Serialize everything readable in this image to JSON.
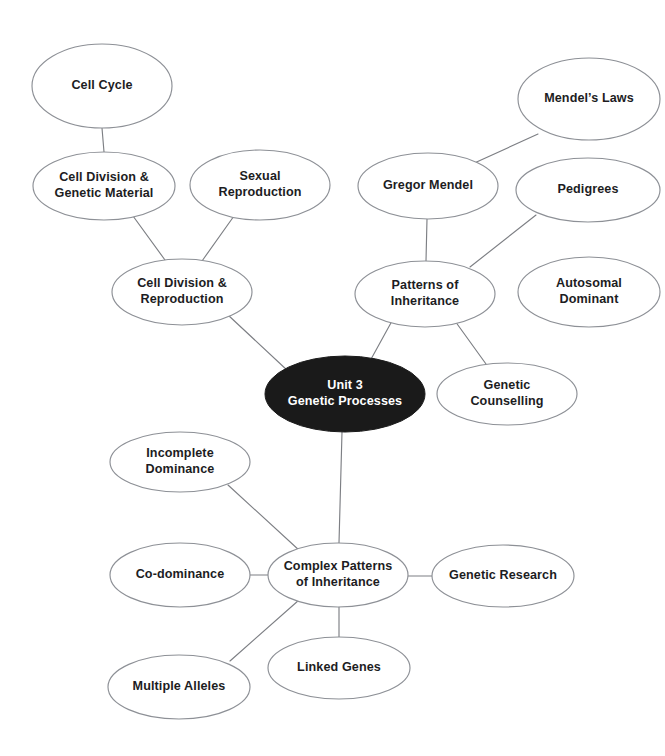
{
  "diagram": {
    "type": "mind-map",
    "background_color": "#ffffff",
    "node_fill_color": "#ffffff",
    "node_stroke_color": "#8d9096",
    "root_fill_color": "#1a1a1a",
    "root_text_color": "#ffffff",
    "edge_color": "#7d7f84",
    "text_color": "#1d1d1f"
  },
  "nodes": [
    {
      "id": "cell-cycle",
      "lines": [
        "Cell Cycle"
      ],
      "cx": 102,
      "cy": 86,
      "rx": 70,
      "ry": 42,
      "root": false
    },
    {
      "id": "cell-division-genetic-material",
      "lines": [
        "Cell Division &",
        "Genetic Material"
      ],
      "cx": 104,
      "cy": 186,
      "rx": 71,
      "ry": 34,
      "root": false
    },
    {
      "id": "sexual-reproduction",
      "lines": [
        "Sexual",
        "Reproduction"
      ],
      "cx": 260,
      "cy": 185,
      "rx": 70,
      "ry": 35,
      "root": false
    },
    {
      "id": "cell-division-reproduction",
      "lines": [
        "Cell Division &",
        "Reproduction"
      ],
      "cx": 182,
      "cy": 292,
      "rx": 70,
      "ry": 33,
      "root": false
    },
    {
      "id": "mendels-laws",
      "lines": [
        "Mendel’s Laws"
      ],
      "cx": 589,
      "cy": 99,
      "rx": 71,
      "ry": 41,
      "root": false
    },
    {
      "id": "gregor-mendel",
      "lines": [
        "Gregor Mendel"
      ],
      "cx": 428,
      "cy": 186,
      "rx": 70,
      "ry": 33,
      "root": false
    },
    {
      "id": "pedigrees",
      "lines": [
        "Pedigrees"
      ],
      "cx": 588,
      "cy": 190,
      "rx": 72,
      "ry": 32,
      "root": false
    },
    {
      "id": "patterns-of-inheritance",
      "lines": [
        "Patterns of",
        "Inheritance"
      ],
      "cx": 425,
      "cy": 294,
      "rx": 70,
      "ry": 33,
      "root": false
    },
    {
      "id": "autosomal-dominant",
      "lines": [
        "Autosomal",
        "Dominant"
      ],
      "cx": 589,
      "cy": 292,
      "rx": 71,
      "ry": 35,
      "root": false
    },
    {
      "id": "genetic-counselling",
      "lines": [
        "Genetic",
        "Counselling"
      ],
      "cx": 507,
      "cy": 394,
      "rx": 70,
      "ry": 31,
      "root": false
    },
    {
      "id": "unit-3-genetic-processes",
      "lines": [
        "Unit 3",
        "Genetic Processes"
      ],
      "cx": 345,
      "cy": 394,
      "rx": 80,
      "ry": 38,
      "root": true
    },
    {
      "id": "incomplete-dominance",
      "lines": [
        "Incomplete",
        "Dominance"
      ],
      "cx": 180,
      "cy": 462,
      "rx": 70,
      "ry": 30,
      "root": false
    },
    {
      "id": "co-dominance",
      "lines": [
        "Co-dominance"
      ],
      "cx": 180,
      "cy": 575,
      "rx": 70,
      "ry": 32,
      "root": false
    },
    {
      "id": "complex-patterns-of-inheritance",
      "lines": [
        "Complex Patterns",
        "of Inheritance"
      ],
      "cx": 338,
      "cy": 575,
      "rx": 70,
      "ry": 32,
      "root": false
    },
    {
      "id": "genetic-research",
      "lines": [
        "Genetic Research"
      ],
      "cx": 503,
      "cy": 576,
      "rx": 71,
      "ry": 31,
      "root": false
    },
    {
      "id": "linked-genes",
      "lines": [
        "Linked Genes"
      ],
      "cx": 339,
      "cy": 668,
      "rx": 71,
      "ry": 31,
      "root": false
    },
    {
      "id": "multiple-alleles",
      "lines": [
        "Multiple Alleles"
      ],
      "cx": 179,
      "cy": 687,
      "rx": 71,
      "ry": 32,
      "root": false
    }
  ],
  "edges": [
    {
      "id": "edge-cell-cycle-to-cdgm",
      "from": "cell-cycle",
      "to": "cell-division-genetic-material",
      "x1": 102,
      "y1": 128,
      "x2": 104,
      "y2": 152
    },
    {
      "id": "edge-cdgm-to-cdr",
      "from": "cell-division-genetic-material",
      "to": "cell-division-reproduction",
      "x1": 133,
      "y1": 216,
      "x2": 165,
      "y2": 260
    },
    {
      "id": "edge-sexrepro-to-cdr",
      "from": "sexual-reproduction",
      "to": "cell-division-reproduction",
      "x1": 234,
      "y1": 216,
      "x2": 202,
      "y2": 261
    },
    {
      "id": "edge-cdr-to-root",
      "from": "cell-division-reproduction",
      "to": "unit-3-genetic-processes",
      "x1": 228,
      "y1": 315,
      "x2": 288,
      "y2": 371
    },
    {
      "id": "edge-mendels-laws-to-gregor",
      "from": "mendels-laws",
      "to": "gregor-mendel",
      "x1": 538,
      "y1": 134,
      "x2": 470,
      "y2": 165
    },
    {
      "id": "edge-gregor-to-patterns",
      "from": "gregor-mendel",
      "to": "patterns-of-inheritance",
      "x1": 427,
      "y1": 219,
      "x2": 426,
      "y2": 261
    },
    {
      "id": "edge-pedigrees-to-patterns",
      "from": "pedigrees",
      "to": "patterns-of-inheritance",
      "x1": 536,
      "y1": 215,
      "x2": 470,
      "y2": 267
    },
    {
      "id": "edge-patterns-to-root",
      "from": "patterns-of-inheritance",
      "to": "unit-3-genetic-processes",
      "x1": 392,
      "y1": 321,
      "x2": 370,
      "y2": 361
    },
    {
      "id": "edge-patterns-to-counselling",
      "from": "patterns-of-inheritance",
      "to": "genetic-counselling",
      "x1": 455,
      "y1": 321,
      "x2": 486,
      "y2": 364
    },
    {
      "id": "edge-root-to-complex",
      "from": "unit-3-genetic-processes",
      "to": "complex-patterns-of-inheritance",
      "x1": 342,
      "y1": 432,
      "x2": 339,
      "y2": 543
    },
    {
      "id": "edge-incomplete-to-complex",
      "from": "incomplete-dominance",
      "to": "complex-patterns-of-inheritance",
      "x1": 228,
      "y1": 485,
      "x2": 300,
      "y2": 551
    },
    {
      "id": "edge-codominance-to-complex",
      "from": "co-dominance",
      "to": "complex-patterns-of-inheritance",
      "x1": 250,
      "y1": 575,
      "x2": 268,
      "y2": 575
    },
    {
      "id": "edge-complex-to-research",
      "from": "complex-patterns-of-inheritance",
      "to": "genetic-research",
      "x1": 408,
      "y1": 576,
      "x2": 432,
      "y2": 576
    },
    {
      "id": "edge-complex-to-linked",
      "from": "complex-patterns-of-inheritance",
      "to": "linked-genes",
      "x1": 339,
      "y1": 607,
      "x2": 339,
      "y2": 637
    },
    {
      "id": "edge-complex-to-multiple",
      "from": "complex-patterns-of-inheritance",
      "to": "multiple-alleles",
      "x1": 299,
      "y1": 600,
      "x2": 230,
      "y2": 661
    }
  ]
}
